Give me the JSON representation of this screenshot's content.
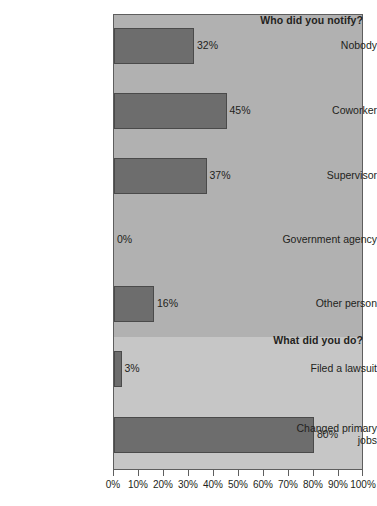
{
  "chart_data": {
    "type": "bar",
    "orientation": "horizontal",
    "title": "",
    "xlabel": "",
    "ylabel": "",
    "xlim": [
      0,
      100
    ],
    "grid": false,
    "legend": false,
    "categories": [
      "Nobody",
      "Coworker",
      "Supervisor",
      "Government agency",
      "Other person",
      "Filed a lawsuit",
      "Changed primary jobs"
    ],
    "values": [
      32,
      45,
      37,
      0,
      16,
      3,
      80
    ],
    "value_labels": [
      "32%",
      "45%",
      "37%",
      "0%",
      "16%",
      "3%",
      "80%"
    ],
    "xticks": [
      0,
      10,
      20,
      30,
      40,
      50,
      60,
      70,
      80,
      90,
      100
    ],
    "xtick_labels": [
      "0%",
      "10%",
      "20%",
      "30%",
      "40%",
      "50%",
      "60%",
      "70%",
      "80%",
      "90%",
      "100%"
    ],
    "groups": [
      {
        "label": "Who did you notify?",
        "categories": [
          "Nobody",
          "Coworker",
          "Supervisor",
          "Government agency",
          "Other person"
        ],
        "background_color": "#b1b1b1"
      },
      {
        "label": "What did you do?",
        "categories": [
          "Filed a lawsuit",
          "Changed primary jobs"
        ],
        "background_color": "#c6c6c6"
      }
    ],
    "bar_color": "#6d6d6d",
    "bar_edge_color": "#4a4a4a",
    "axis_color": "#5e5e5e",
    "text_color": "#231f20",
    "page_background": "#ffffff"
  },
  "rows": [
    {
      "label": "Nobody",
      "value_label": "32%"
    },
    {
      "label": "Coworker",
      "value_label": "45%"
    },
    {
      "label": "Supervisor",
      "value_label": "37%"
    },
    {
      "label": "Government agency",
      "value_label": "0%"
    },
    {
      "label": "Other person",
      "value_label": "16%"
    },
    {
      "label": "Filed a lawsuit",
      "value_label": "3%"
    },
    {
      "label": "Changed primary jobs",
      "value_label": "80%"
    }
  ],
  "bands": {
    "upper_title": "Who did you notify?",
    "lower_title": "What did you do?"
  }
}
